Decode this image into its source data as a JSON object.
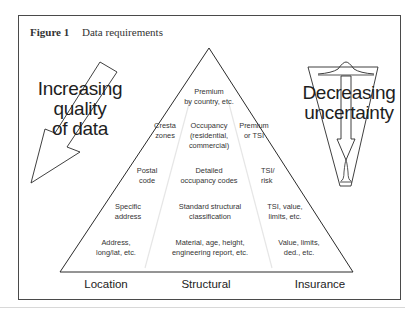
{
  "figure": {
    "number_label": "Figure 1",
    "title": "Data requirements"
  },
  "left_arrow": {
    "lines": [
      "Increasing",
      "quality",
      "of data"
    ]
  },
  "right_funnel": {
    "lines": [
      "Decreasing",
      "uncertainty"
    ]
  },
  "pyramid": {
    "apex": {
      "lines": [
        "Premium",
        "by country, etc."
      ]
    },
    "location": [
      {
        "lines": [
          "Cresta",
          "zones"
        ]
      },
      {
        "lines": [
          "Postal",
          "code"
        ]
      },
      {
        "lines": [
          "Specific",
          "address"
        ]
      },
      {
        "lines": [
          "Address,",
          "long/lat, etc."
        ]
      }
    ],
    "structural": [
      {
        "lines": [
          "Occupancy",
          "(residential,",
          "commercial)"
        ]
      },
      {
        "lines": [
          "Detailed",
          "occupancy codes"
        ]
      },
      {
        "lines": [
          "Standard structural",
          "classification"
        ]
      },
      {
        "lines": [
          "Material, age, height,",
          "engineering report, etc."
        ]
      }
    ],
    "insurance": [
      {
        "lines": [
          "Premium",
          "or TSI"
        ]
      },
      {
        "lines": [
          "TSI/",
          "risk"
        ]
      },
      {
        "lines": [
          "TSI, value,",
          "limits, etc."
        ]
      },
      {
        "lines": [
          "Value, limits,",
          "ded., etc."
        ]
      }
    ]
  },
  "columns": {
    "location": "Location",
    "structural": "Structural",
    "insurance": "Insurance"
  }
}
